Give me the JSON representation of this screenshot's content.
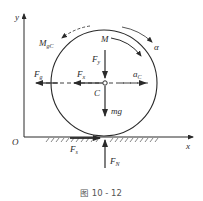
{
  "figure": {
    "caption": "图 10 - 12"
  },
  "axes": {
    "x_label": "x",
    "y_label": "y",
    "origin_label": "O"
  },
  "labels": {
    "inertial_moment": "M",
    "inertial_moment_sub": "gC",
    "applied_moment": "M",
    "angular_accel": "α",
    "force_y": "F",
    "force_y_sub": "y",
    "force_x": "F",
    "force_x_sub": "x",
    "inertial_force": "F",
    "inertial_force_sub": "g",
    "accel": "a",
    "accel_sub": "C",
    "center": "C",
    "weight": "mg",
    "friction": "F",
    "friction_sub": "s",
    "normal": "F",
    "normal_sub": "N"
  },
  "colors": {
    "stroke": "#2a2a2a",
    "caption": "#555555"
  }
}
